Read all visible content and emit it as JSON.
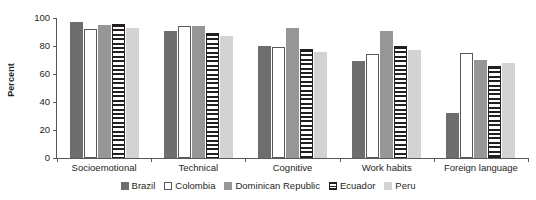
{
  "chart_data": {
    "type": "bar",
    "title": "",
    "subtitle": "",
    "xlabel": "",
    "ylabel": "Percent",
    "ylim": [
      0,
      100
    ],
    "yticks": [
      0,
      20,
      40,
      60,
      80,
      100
    ],
    "grid": false,
    "legend_position": "bottom",
    "categories": [
      "Socioemotional",
      "Technical",
      "Cognitive",
      "Work habits",
      "Foreign language"
    ],
    "series": [
      {
        "name": "Brazil",
        "color": "#6d6e70",
        "style": "solid-dark-gray",
        "values": [
          97,
          91,
          80,
          69,
          32
        ]
      },
      {
        "name": "Colombia",
        "color": "#ffffff",
        "style": "outline-white",
        "values": [
          92,
          94,
          79,
          74,
          75
        ]
      },
      {
        "name": "Dominican Republic",
        "color": "#959697",
        "style": "solid-mid-gray",
        "values": [
          95,
          94,
          93,
          91,
          70
        ]
      },
      {
        "name": "Ecuador",
        "color": "#231f20",
        "style": "horizontal-stripes",
        "values": [
          96,
          89,
          78,
          80,
          66
        ]
      },
      {
        "name": "Peru",
        "color": "#d2d3d4",
        "style": "solid-light-gray",
        "values": [
          93,
          87,
          76,
          77,
          68
        ]
      }
    ]
  },
  "axis": {
    "y_title": "Percent"
  }
}
